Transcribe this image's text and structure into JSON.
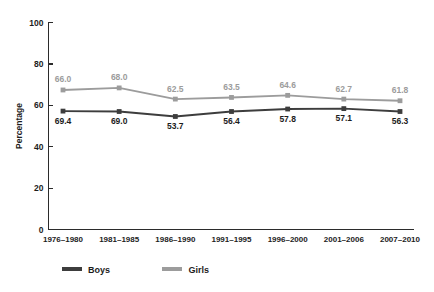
{
  "chart_data": {
    "type": "line",
    "title": "",
    "xlabel": "",
    "ylabel": "Percentage",
    "ylim": [
      0,
      100
    ],
    "yticks": [
      0,
      20,
      40,
      60,
      80,
      100
    ],
    "grid": false,
    "legend_position": "bottom-center",
    "categories": [
      "1976–1980",
      "1981–1985",
      "1986–1990",
      "1991–1995",
      "1996–2000",
      "2001–2006",
      "2007–2010"
    ],
    "series": [
      {
        "name": "Boys",
        "color": "#3d3d3d",
        "label_color": "#1c1c1c",
        "label_position": "below",
        "values": [
          57.2,
          57.0,
          54.6,
          57.0,
          58.2,
          58.4,
          57.0
        ],
        "data_labels": [
          "69.4",
          "69.0",
          "53.7",
          "56.4",
          "57.8",
          "57.1",
          "56.3"
        ]
      },
      {
        "name": "Girls",
        "color": "#9c9c9c",
        "label_color": "#9c9c9c",
        "label_position": "above",
        "values": [
          67.4,
          68.4,
          63.0,
          63.8,
          64.8,
          63.0,
          62.2
        ],
        "data_labels": [
          "66.0",
          "68.0",
          "62.5",
          "63.5",
          "64.6",
          "62.7",
          "61.8"
        ]
      }
    ],
    "legend": [
      {
        "label": "Boys",
        "color": "#3d3d3d"
      },
      {
        "label": "Girls",
        "color": "#9c9c9c"
      }
    ]
  }
}
